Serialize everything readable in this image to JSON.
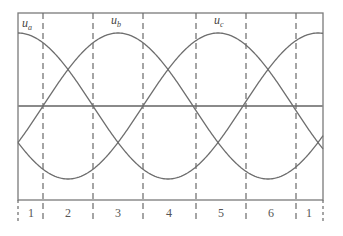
{
  "diagram": {
    "curves": [
      {
        "name": "u_a",
        "label_main": "u",
        "label_sub": "a",
        "peak_x": 18
      },
      {
        "name": "u_b",
        "label_main": "u",
        "label_sub": "b",
        "peak_x": 118
      },
      {
        "name": "u_c",
        "label_main": "u",
        "label_sub": "c",
        "peak_x": 218
      }
    ],
    "sector_labels": [
      "1",
      "2",
      "3",
      "4",
      "5",
      "6",
      "1"
    ],
    "colors": {
      "curve": "#6e6e6e",
      "frame": "#7a7a7a",
      "text": "#444444"
    }
  }
}
